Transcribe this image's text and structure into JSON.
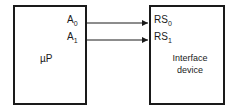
{
  "diagram": {
    "blocks": [
      {
        "id": "microprocessor",
        "label": "µP",
        "pins": [
          {
            "name": "A",
            "sub": "0"
          },
          {
            "name": "A",
            "sub": "1"
          }
        ]
      },
      {
        "id": "interface-device",
        "label_line1": "Interface",
        "label_line2": "device",
        "pins": [
          {
            "name": "RS",
            "sub": "0"
          },
          {
            "name": "RS",
            "sub": "1"
          }
        ]
      }
    ],
    "connections": [
      {
        "from": "A0",
        "to": "RS0"
      },
      {
        "from": "A1",
        "to": "RS1"
      }
    ],
    "colors": {
      "stroke": "#1a1a1a",
      "background": "#ffffff"
    }
  }
}
